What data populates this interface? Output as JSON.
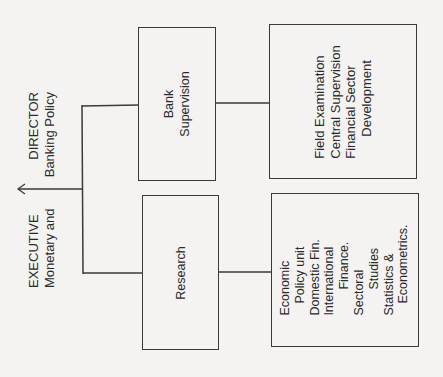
{
  "diagram": {
    "type": "org-chart",
    "orientation": "rotated-90-ccw",
    "root": {
      "title_line1_left": "EXECUTIVE",
      "title_line1_right": "DIRECTOR",
      "title_line2_left": "Monetary and",
      "title_line2_right": "Banking Policy"
    },
    "divisions": [
      {
        "name_lines": [
          "Bank",
          "Supervision"
        ],
        "units": [
          "Field Examination",
          "Central Supervision",
          "Financial Sector",
          "Development"
        ]
      },
      {
        "name_lines": [
          "Research"
        ],
        "units": [
          "Economic",
          "Policy unit",
          "Domestic Fin.",
          "International",
          "Finance.",
          "Sectoral",
          "Studies",
          "Statistics &",
          "Econometrics."
        ]
      }
    ]
  },
  "colors": {
    "line": "#3a3a3a",
    "background": "#f4f3f1"
  }
}
